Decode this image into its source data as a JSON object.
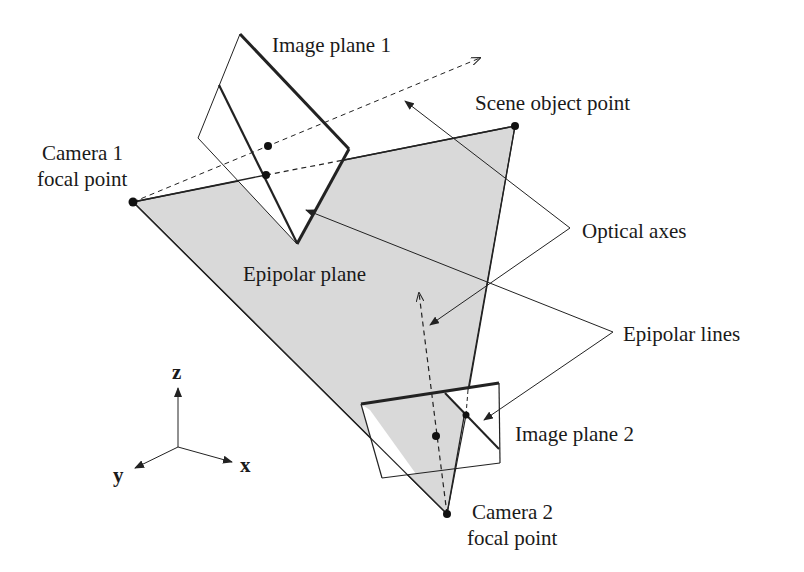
{
  "diagram": {
    "type": "epipolar-geometry",
    "colors": {
      "plane_fill": "#d9d9d9",
      "stroke": "#222222",
      "background": "#ffffff"
    },
    "labels": {
      "image_plane_1": "Image plane 1",
      "scene_object_point": "Scene object point",
      "camera1_line1": "Camera 1",
      "camera1_line2": "focal point",
      "optical_axes": "Optical axes",
      "epipolar_plane": "Epipolar plane",
      "epipolar_lines": "Epipolar lines",
      "image_plane_2": "Image plane 2",
      "camera2_line1": "Camera 2",
      "camera2_line2": "focal point"
    },
    "axes": {
      "z": "z",
      "y": "y",
      "x": "x"
    },
    "nodes": [
      {
        "id": "camera1",
        "label": "Camera 1 focal point"
      },
      {
        "id": "camera2",
        "label": "Camera 2 focal point"
      },
      {
        "id": "scene_point",
        "label": "Scene object point"
      },
      {
        "id": "image_plane_1",
        "label": "Image plane 1"
      },
      {
        "id": "image_plane_2",
        "label": "Image plane 2"
      },
      {
        "id": "epipolar_plane",
        "label": "Epipolar plane"
      }
    ]
  }
}
